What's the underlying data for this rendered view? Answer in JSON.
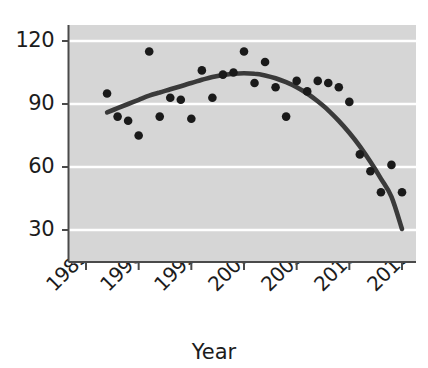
{
  "chart_data": {
    "type": "scatter",
    "title": "",
    "subtitle": "",
    "xlabel": "Year",
    "ylabel": "",
    "xlim": [
      1984,
      2016
    ],
    "ylim": [
      17,
      127
    ],
    "xticks": [
      1985,
      1990,
      1995,
      2000,
      2005,
      2010,
      2015
    ],
    "xtick_labels": [
      "1985",
      "1990",
      "1995",
      "2000",
      "2005",
      "2010",
      "2015"
    ],
    "yticks": [
      30,
      60,
      90,
      120
    ],
    "ytick_labels": [
      "30",
      "90",
      "60",
      "120"
    ],
    "grid": "horizontal-white",
    "legend": "none",
    "x": [
      1987,
      1988,
      1989,
      1990,
      1991,
      1992,
      1993,
      1994,
      1995,
      1996,
      1997,
      1998,
      1999,
      2000,
      2001,
      2002,
      2003,
      2004,
      2005,
      2006,
      2007,
      2008,
      2009,
      2010,
      2011,
      2012,
      2013,
      2014,
      2015
    ],
    "values": [
      95,
      84,
      82,
      75,
      115,
      84,
      93,
      92,
      83,
      106,
      93,
      104,
      105,
      115,
      100,
      110,
      98,
      84,
      101,
      96,
      101,
      100,
      98,
      91,
      66,
      58,
      48,
      61,
      48
    ],
    "series": [
      {
        "name": "observations",
        "marker": "filled-circle",
        "color": "#1a1a1a",
        "values": [
          95,
          84,
          82,
          75,
          115,
          84,
          93,
          92,
          83,
          106,
          93,
          104,
          105,
          115,
          100,
          110,
          98,
          84,
          101,
          96,
          101,
          100,
          98,
          91,
          66,
          58,
          48,
          61,
          48
        ]
      },
      {
        "name": "smoothed-trend",
        "type": "line",
        "color": "#3a3a3a",
        "x": [
          1987,
          1988,
          1989,
          1990,
          1991,
          1992,
          1993,
          1994,
          1995,
          1996,
          1997,
          1998,
          1999,
          2000,
          2001,
          2002,
          2003,
          2004,
          2005,
          2006,
          2007,
          2008,
          2009,
          2010,
          2011,
          2012,
          2013,
          2014,
          2015
        ],
        "values": [
          86,
          88,
          90,
          92,
          94,
          95.5,
          97,
          98.5,
          100,
          101.5,
          102.8,
          103.8,
          104.4,
          104.6,
          104.4,
          103.6,
          102.3,
          100.4,
          98,
          95,
          91.3,
          87,
          82,
          76.3,
          69.8,
          62.5,
          54.5,
          45.8,
          30.5
        ]
      }
    ],
    "points_xy": [
      {
        "year": 1987,
        "value": 95
      },
      {
        "year": 1988,
        "value": 84
      },
      {
        "year": 1989,
        "value": 82
      },
      {
        "year": 1990,
        "value": 75
      },
      {
        "year": 1991,
        "value": 115
      },
      {
        "year": 1992,
        "value": 84
      },
      {
        "year": 1993,
        "value": 93
      },
      {
        "year": 1994,
        "value": 92
      },
      {
        "year": 1995,
        "value": 83
      },
      {
        "year": 1996,
        "value": 106
      },
      {
        "year": 1997,
        "value": 93
      },
      {
        "year": 1998,
        "value": 104
      },
      {
        "year": 1999,
        "value": 105
      },
      {
        "year": 2000,
        "value": 115
      },
      {
        "year": 2001,
        "value": 100
      },
      {
        "year": 2002,
        "value": 110
      },
      {
        "year": 2003,
        "value": 98
      },
      {
        "year": 2004,
        "value": 84
      },
      {
        "year": 2005,
        "value": 101
      },
      {
        "year": 2006,
        "value": 96
      },
      {
        "year": 2007,
        "value": 101
      },
      {
        "year": 2008,
        "value": 100
      },
      {
        "year": 2009,
        "value": 98
      },
      {
        "year": 2010,
        "value": 91
      },
      {
        "year": 2011,
        "value": 66
      },
      {
        "year": 2012,
        "value": 58
      },
      {
        "year": 2013,
        "value": 48
      },
      {
        "year": 2014,
        "value": 61
      },
      {
        "year": 2015,
        "value": 48
      }
    ],
    "endpoint": {
      "year": 2015,
      "value": 30.5
    },
    "colors": {
      "plot_background": "#d6d6d6",
      "gridline": "#ffffff",
      "marker": "#1a1a1a",
      "trend_line": "#3a3a3a",
      "axis": "#4a4a4a",
      "text": "#1c1c1c",
      "page_background": "#ffffff"
    }
  },
  "axis": {
    "x_title": "Year",
    "y_tick_120": "120",
    "y_tick_90": "90",
    "y_tick_60": "60",
    "y_tick_30": "30",
    "x_tick_1985": "1985",
    "x_tick_1990": "1990",
    "x_tick_1995": "1995",
    "x_tick_2000": "2000",
    "x_tick_2005": "2005",
    "x_tick_2010": "2010",
    "x_tick_2015": "2015"
  }
}
